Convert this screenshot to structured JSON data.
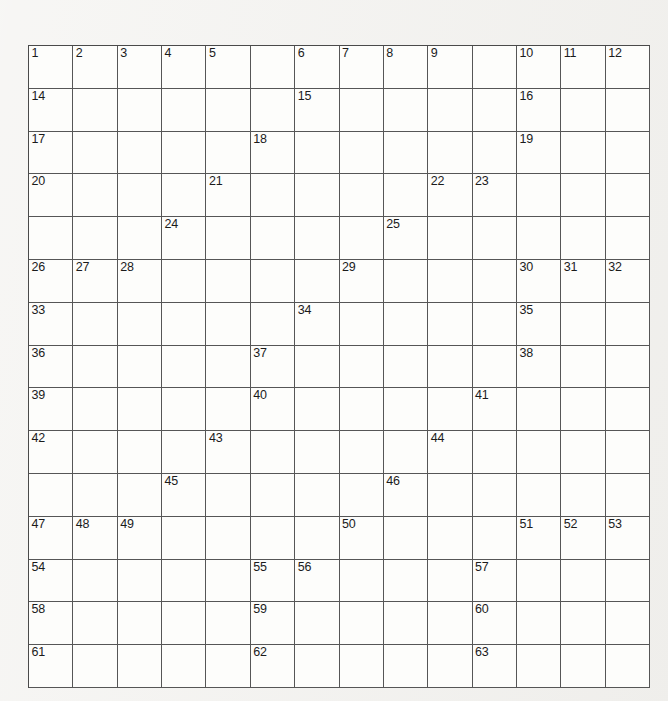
{
  "puzzle": {
    "type": "crossword-grid",
    "columns": 14,
    "rows": 15,
    "background_color": "#f3f2ef",
    "cell_color": "#fdfdfb",
    "block_color": "#211f1e",
    "grid_line_color": "#565656",
    "number_color": "#1b1b1b",
    "highest_number": 63,
    "rows_data": [
      {
        "index": 1,
        "cells": [
          {
            "block": false,
            "number": "1"
          },
          {
            "block": false,
            "number": "2"
          },
          {
            "block": false,
            "number": "3"
          },
          {
            "block": false,
            "number": "4"
          },
          {
            "block": false,
            "number": "5"
          },
          {
            "block": true,
            "number": ""
          },
          {
            "block": false,
            "number": "6"
          },
          {
            "block": false,
            "number": "7"
          },
          {
            "block": false,
            "number": "8"
          },
          {
            "block": false,
            "number": "9"
          },
          {
            "block": true,
            "number": ""
          },
          {
            "block": false,
            "number": "10"
          },
          {
            "block": false,
            "number": "11"
          },
          {
            "block": false,
            "number": "12"
          }
        ]
      },
      {
        "index": 2,
        "cells": [
          {
            "block": false,
            "number": "14"
          },
          {
            "block": false,
            "number": ""
          },
          {
            "block": false,
            "number": ""
          },
          {
            "block": false,
            "number": ""
          },
          {
            "block": false,
            "number": ""
          },
          {
            "block": true,
            "number": ""
          },
          {
            "block": false,
            "number": "15"
          },
          {
            "block": false,
            "number": ""
          },
          {
            "block": false,
            "number": ""
          },
          {
            "block": false,
            "number": ""
          },
          {
            "block": true,
            "number": ""
          },
          {
            "block": false,
            "number": "16"
          },
          {
            "block": false,
            "number": ""
          },
          {
            "block": false,
            "number": ""
          }
        ]
      },
      {
        "index": 3,
        "cells": [
          {
            "block": false,
            "number": "17"
          },
          {
            "block": false,
            "number": ""
          },
          {
            "block": false,
            "number": ""
          },
          {
            "block": false,
            "number": ""
          },
          {
            "block": false,
            "number": ""
          },
          {
            "block": false,
            "number": "18"
          },
          {
            "block": false,
            "number": ""
          },
          {
            "block": false,
            "number": ""
          },
          {
            "block": false,
            "number": ""
          },
          {
            "block": false,
            "number": ""
          },
          {
            "block": true,
            "number": ""
          },
          {
            "block": false,
            "number": "19"
          },
          {
            "block": false,
            "number": ""
          },
          {
            "block": false,
            "number": ""
          }
        ]
      },
      {
        "index": 4,
        "cells": [
          {
            "block": false,
            "number": "20"
          },
          {
            "block": false,
            "number": ""
          },
          {
            "block": false,
            "number": ""
          },
          {
            "block": true,
            "number": ""
          },
          {
            "block": false,
            "number": "21"
          },
          {
            "block": false,
            "number": ""
          },
          {
            "block": false,
            "number": ""
          },
          {
            "block": false,
            "number": ""
          },
          {
            "block": true,
            "number": ""
          },
          {
            "block": false,
            "number": "22"
          },
          {
            "block": false,
            "number": "23"
          },
          {
            "block": false,
            "number": ""
          },
          {
            "block": false,
            "number": ""
          },
          {
            "block": false,
            "number": ""
          }
        ]
      },
      {
        "index": 5,
        "cells": [
          {
            "block": true,
            "number": ""
          },
          {
            "block": true,
            "number": ""
          },
          {
            "block": true,
            "number": ""
          },
          {
            "block": false,
            "number": "24"
          },
          {
            "block": false,
            "number": ""
          },
          {
            "block": false,
            "number": ""
          },
          {
            "block": false,
            "number": ""
          },
          {
            "block": true,
            "number": ""
          },
          {
            "block": false,
            "number": "25"
          },
          {
            "block": false,
            "number": ""
          },
          {
            "block": false,
            "number": ""
          },
          {
            "block": true,
            "number": ""
          },
          {
            "block": true,
            "number": ""
          },
          {
            "block": true,
            "number": ""
          }
        ]
      },
      {
        "index": 6,
        "cells": [
          {
            "block": false,
            "number": "26"
          },
          {
            "block": false,
            "number": "27"
          },
          {
            "block": false,
            "number": "28"
          },
          {
            "block": false,
            "number": ""
          },
          {
            "block": false,
            "number": ""
          },
          {
            "block": false,
            "number": ""
          },
          {
            "block": true,
            "number": ""
          },
          {
            "block": false,
            "number": "29"
          },
          {
            "block": false,
            "number": ""
          },
          {
            "block": false,
            "number": ""
          },
          {
            "block": false,
            "number": ""
          },
          {
            "block": false,
            "number": "30"
          },
          {
            "block": false,
            "number": "31"
          },
          {
            "block": false,
            "number": "32"
          }
        ]
      },
      {
        "index": 7,
        "cells": [
          {
            "block": false,
            "number": "33"
          },
          {
            "block": false,
            "number": ""
          },
          {
            "block": false,
            "number": ""
          },
          {
            "block": false,
            "number": ""
          },
          {
            "block": false,
            "number": ""
          },
          {
            "block": true,
            "number": ""
          },
          {
            "block": false,
            "number": "34"
          },
          {
            "block": false,
            "number": ""
          },
          {
            "block": false,
            "number": ""
          },
          {
            "block": false,
            "number": ""
          },
          {
            "block": true,
            "number": ""
          },
          {
            "block": false,
            "number": "35"
          },
          {
            "block": false,
            "number": ""
          },
          {
            "block": false,
            "number": ""
          }
        ]
      },
      {
        "index": 8,
        "cells": [
          {
            "block": false,
            "number": "36"
          },
          {
            "block": false,
            "number": ""
          },
          {
            "block": false,
            "number": ""
          },
          {
            "block": false,
            "number": ""
          },
          {
            "block": true,
            "number": ""
          },
          {
            "block": false,
            "number": "37"
          },
          {
            "block": false,
            "number": ""
          },
          {
            "block": false,
            "number": ""
          },
          {
            "block": false,
            "number": ""
          },
          {
            "block": false,
            "number": ""
          },
          {
            "block": true,
            "number": ""
          },
          {
            "block": false,
            "number": "38"
          },
          {
            "block": false,
            "number": ""
          },
          {
            "block": false,
            "number": ""
          }
        ]
      },
      {
        "index": 9,
        "cells": [
          {
            "block": false,
            "number": "39"
          },
          {
            "block": false,
            "number": ""
          },
          {
            "block": false,
            "number": ""
          },
          {
            "block": false,
            "number": ""
          },
          {
            "block": true,
            "number": ""
          },
          {
            "block": false,
            "number": "40"
          },
          {
            "block": false,
            "number": ""
          },
          {
            "block": false,
            "number": ""
          },
          {
            "block": false,
            "number": ""
          },
          {
            "block": true,
            "number": ""
          },
          {
            "block": false,
            "number": "41"
          },
          {
            "block": false,
            "number": ""
          },
          {
            "block": false,
            "number": ""
          },
          {
            "block": false,
            "number": ""
          }
        ]
      },
      {
        "index": 10,
        "cells": [
          {
            "block": false,
            "number": "42"
          },
          {
            "block": false,
            "number": ""
          },
          {
            "block": false,
            "number": ""
          },
          {
            "block": false,
            "number": ""
          },
          {
            "block": false,
            "number": "43"
          },
          {
            "block": false,
            "number": ""
          },
          {
            "block": false,
            "number": ""
          },
          {
            "block": false,
            "number": ""
          },
          {
            "block": true,
            "number": ""
          },
          {
            "block": false,
            "number": "44"
          },
          {
            "block": false,
            "number": ""
          },
          {
            "block": false,
            "number": ""
          },
          {
            "block": false,
            "number": ""
          },
          {
            "block": false,
            "number": ""
          }
        ]
      },
      {
        "index": 11,
        "cells": [
          {
            "block": true,
            "number": ""
          },
          {
            "block": true,
            "number": ""
          },
          {
            "block": true,
            "number": ""
          },
          {
            "block": false,
            "number": "45"
          },
          {
            "block": false,
            "number": ""
          },
          {
            "block": false,
            "number": ""
          },
          {
            "block": false,
            "number": ""
          },
          {
            "block": true,
            "number": ""
          },
          {
            "block": false,
            "number": "46"
          },
          {
            "block": false,
            "number": ""
          },
          {
            "block": false,
            "number": ""
          },
          {
            "block": true,
            "number": ""
          },
          {
            "block": true,
            "number": ""
          },
          {
            "block": true,
            "number": ""
          }
        ]
      },
      {
        "index": 12,
        "cells": [
          {
            "block": false,
            "number": "47"
          },
          {
            "block": false,
            "number": "48"
          },
          {
            "block": false,
            "number": "49"
          },
          {
            "block": false,
            "number": ""
          },
          {
            "block": false,
            "number": ""
          },
          {
            "block": false,
            "number": ""
          },
          {
            "block": true,
            "number": ""
          },
          {
            "block": false,
            "number": "50"
          },
          {
            "block": false,
            "number": ""
          },
          {
            "block": false,
            "number": ""
          },
          {
            "block": true,
            "number": ""
          },
          {
            "block": false,
            "number": "51"
          },
          {
            "block": false,
            "number": "52"
          },
          {
            "block": false,
            "number": "53"
          }
        ]
      },
      {
        "index": 13,
        "cells": [
          {
            "block": false,
            "number": "54"
          },
          {
            "block": false,
            "number": ""
          },
          {
            "block": false,
            "number": ""
          },
          {
            "block": false,
            "number": ""
          },
          {
            "block": true,
            "number": ""
          },
          {
            "block": false,
            "number": "55"
          },
          {
            "block": false,
            "number": "56"
          },
          {
            "block": false,
            "number": ""
          },
          {
            "block": false,
            "number": ""
          },
          {
            "block": false,
            "number": ""
          },
          {
            "block": false,
            "number": "57"
          },
          {
            "block": false,
            "number": ""
          },
          {
            "block": false,
            "number": ""
          },
          {
            "block": false,
            "number": ""
          }
        ]
      },
      {
        "index": 14,
        "cells": [
          {
            "block": false,
            "number": "58"
          },
          {
            "block": false,
            "number": ""
          },
          {
            "block": false,
            "number": ""
          },
          {
            "block": false,
            "number": ""
          },
          {
            "block": true,
            "number": ""
          },
          {
            "block": false,
            "number": "59"
          },
          {
            "block": false,
            "number": ""
          },
          {
            "block": false,
            "number": ""
          },
          {
            "block": false,
            "number": ""
          },
          {
            "block": true,
            "number": ""
          },
          {
            "block": false,
            "number": "60"
          },
          {
            "block": false,
            "number": ""
          },
          {
            "block": false,
            "number": ""
          },
          {
            "block": false,
            "number": ""
          }
        ]
      },
      {
        "index": 15,
        "cells": [
          {
            "block": false,
            "number": "61"
          },
          {
            "block": false,
            "number": ""
          },
          {
            "block": false,
            "number": ""
          },
          {
            "block": false,
            "number": ""
          },
          {
            "block": true,
            "number": ""
          },
          {
            "block": false,
            "number": "62"
          },
          {
            "block": false,
            "number": ""
          },
          {
            "block": false,
            "number": ""
          },
          {
            "block": false,
            "number": ""
          },
          {
            "block": true,
            "number": ""
          },
          {
            "block": false,
            "number": "63"
          },
          {
            "block": false,
            "number": ""
          },
          {
            "block": false,
            "number": ""
          },
          {
            "block": false,
            "number": ""
          }
        ]
      }
    ],
    "extra_numbers": {
      "row1_col14": "13"
    }
  }
}
